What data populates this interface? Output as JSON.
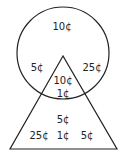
{
  "diagram": {
    "type": "venn-circle-triangle",
    "stroke_color": "#222222",
    "background": "#ffffff",
    "shapes": {
      "circle": {
        "cx": 63,
        "cy": 53,
        "r": 46
      },
      "triangle": {
        "apex": [
          63,
          56
        ],
        "base_left": [
          10,
          149
        ],
        "base_right": [
          117,
          149
        ]
      }
    },
    "regions": {
      "circle_only": [
        "10¢",
        "5¢",
        "25¢"
      ],
      "intersection": [
        "10¢",
        "1¢"
      ],
      "triangle_only": [
        "5¢",
        "25¢",
        "1¢",
        "5¢"
      ]
    },
    "labels": [
      {
        "id": "circle-top",
        "text": "10¢",
        "x": 62,
        "y": 27
      },
      {
        "id": "circle-left",
        "text": "5¢",
        "x": 37,
        "y": 68
      },
      {
        "id": "circle-right",
        "text": "25¢",
        "x": 92,
        "y": 68
      },
      {
        "id": "overlap-top",
        "text": "10¢",
        "x": 63,
        "y": 81
      },
      {
        "id": "overlap-bottom",
        "text": "1¢",
        "x": 63,
        "y": 94
      },
      {
        "id": "triangle-top",
        "text": "5¢",
        "x": 63,
        "y": 120
      },
      {
        "id": "triangle-left",
        "text": "25¢",
        "x": 39,
        "y": 136
      },
      {
        "id": "triangle-middle",
        "text": "1¢",
        "x": 63,
        "y": 136
      },
      {
        "id": "triangle-right",
        "text": "5¢",
        "x": 87,
        "y": 136
      }
    ]
  }
}
